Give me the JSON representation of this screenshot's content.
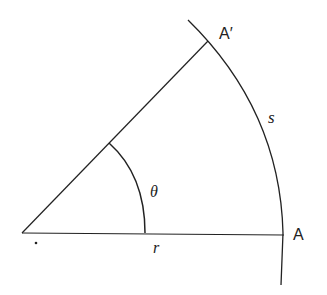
{
  "diagram": {
    "labels": {
      "point_a": "A",
      "point_a_prime": "A′",
      "arc_length": "s",
      "radius": "r",
      "angle": "θ"
    },
    "colors": {
      "stroke": "#222222",
      "background": "#ffffff"
    }
  }
}
